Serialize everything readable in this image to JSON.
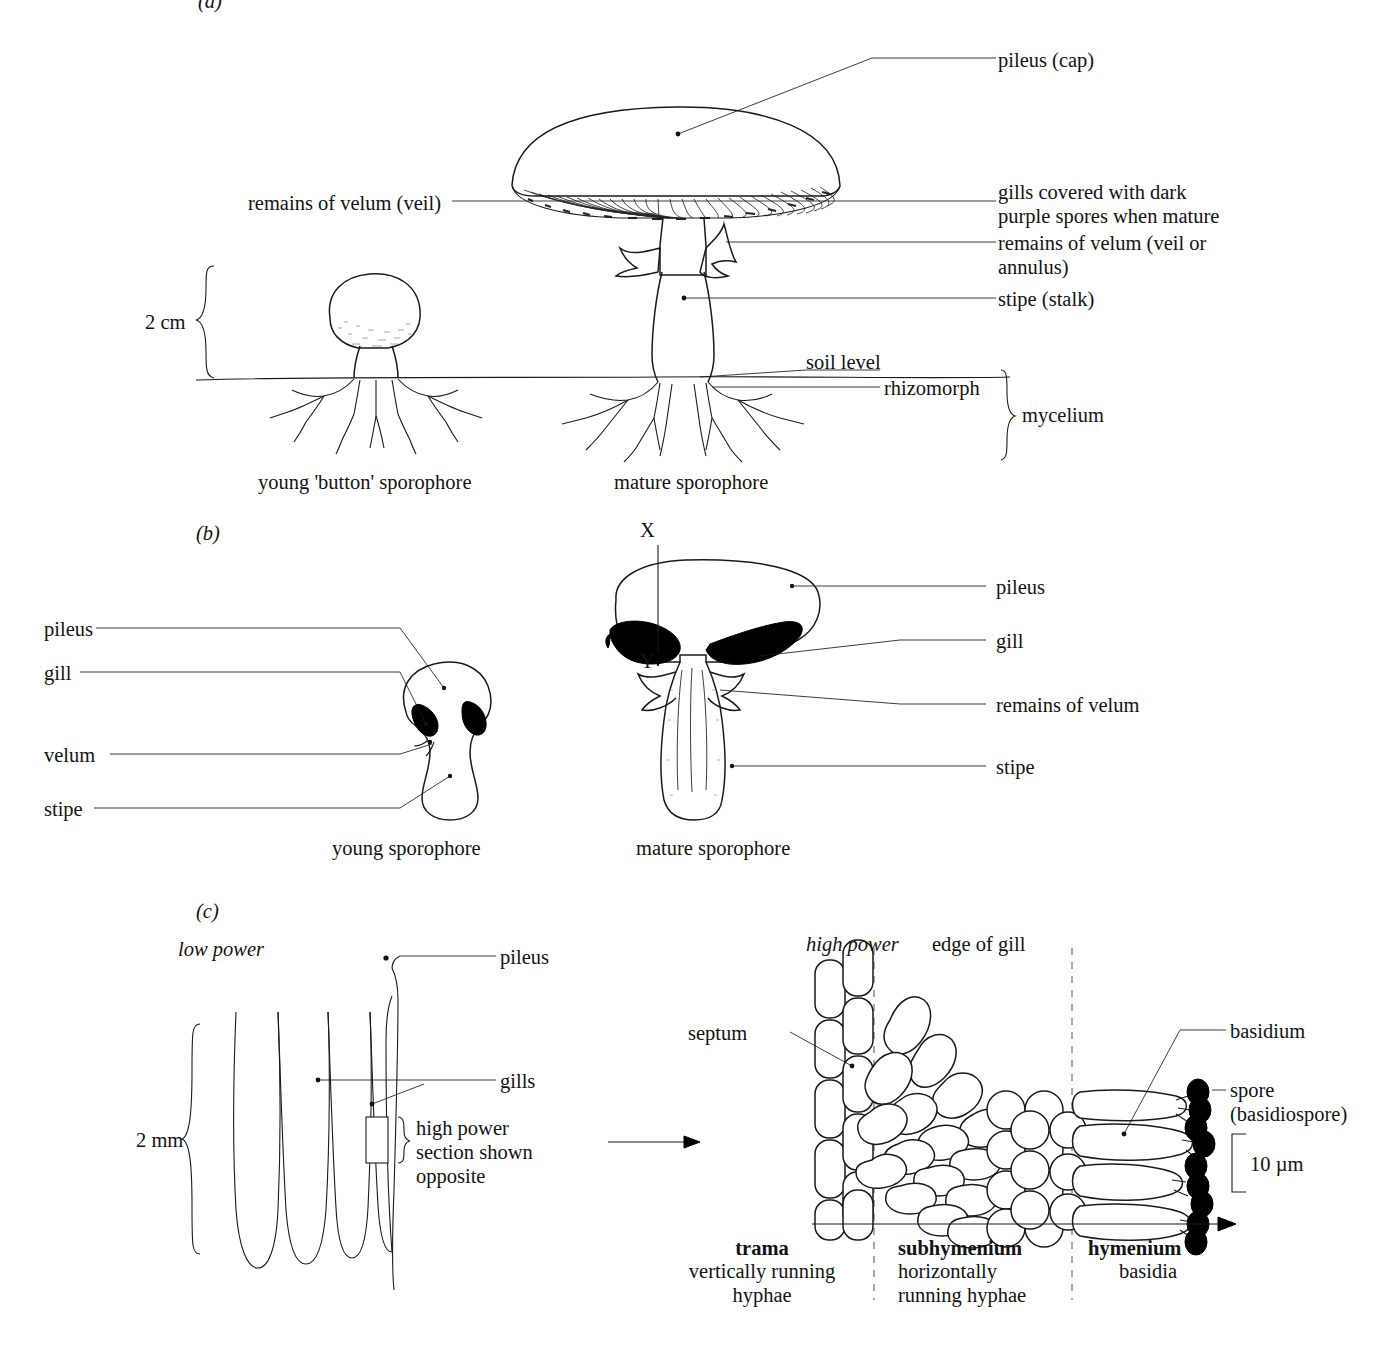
{
  "figure": {
    "title_visible": false,
    "panels": [
      {
        "id": "(a)",
        "scale_label": "2 cm",
        "captions": [
          "young 'button' sporophore",
          "mature sporophore"
        ],
        "labels": {
          "pileus": "pileus (cap)",
          "velum_left": "remains of velum (veil)",
          "gills": "gills covered with dark\npurple spores when mature",
          "velum_right": "remains of velum (veil or\nannulus)",
          "stipe": "stipe (stalk)",
          "soil_level": "soil level",
          "rhizomorph": "rhizomorph",
          "mycelium": "mycelium"
        }
      },
      {
        "id": "(b)",
        "captions": [
          "young sporophore",
          "mature sporophore"
        ],
        "section_markers": [
          "X",
          "Y"
        ],
        "left_labels": [
          "pileus",
          "gill",
          "velum",
          "stipe"
        ],
        "right_labels": [
          "pileus",
          "gill",
          "remains of velum",
          "stipe"
        ]
      },
      {
        "id": "(c)",
        "low_power_label": "low power",
        "high_power_label": "high power",
        "edge_of_gill_label": "edge of gill",
        "scale_low": "2 mm",
        "scale_high": "10 µm",
        "labels": {
          "pileus": "pileus",
          "gills": "gills",
          "box_note": "high power\nsection shown\nopposite",
          "septum": "septum",
          "basidium": "basidium",
          "spore": "spore\n(basidiospore)"
        },
        "zones": [
          {
            "name": "trama",
            "desc": "vertically running\nhyphae"
          },
          {
            "name": "subhymenium",
            "desc": "horizontally\nrunning hyphae"
          },
          {
            "name": "hymenium",
            "desc": "basidia"
          }
        ]
      }
    ]
  },
  "colors": {
    "ink": "#131313",
    "dash": "#7a7a7a",
    "spore": "#000000"
  }
}
